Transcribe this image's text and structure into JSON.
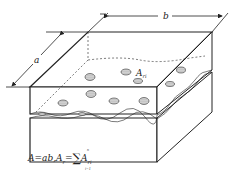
{
  "figure": {
    "labels": {
      "width_dimension": "b",
      "depth_dimension": "a",
      "contact_spot": "A",
      "contact_spot_sub": "ri"
    },
    "formula": {
      "lhs": "A=ab,",
      "rhs_var": "A",
      "rhs_sub": "r",
      "equals": "=",
      "sigma": "∑",
      "upper_limit": "n",
      "lower_limit": "i=1",
      "term": "A",
      "term_sub": "ri"
    },
    "colors": {
      "line": "#222222",
      "spot_fill": "#cfcfcf",
      "background": "#ffffff"
    }
  }
}
